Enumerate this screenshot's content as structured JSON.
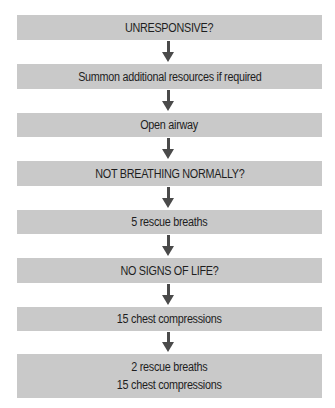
{
  "diagram": {
    "type": "flowchart",
    "direction": "top-to-bottom",
    "colors": {
      "box_fill": "#c9c9c9",
      "arrow": "#4a4a4a",
      "text": "#1e1e1e",
      "background": "#ffffff"
    },
    "steps": [
      {
        "id": "unresponsive",
        "lines": [
          "UNRESPONSIVE?"
        ]
      },
      {
        "id": "summon-resources",
        "lines": [
          "Summon additional resources if required"
        ]
      },
      {
        "id": "open-airway",
        "lines": [
          "Open airway"
        ]
      },
      {
        "id": "not-breathing",
        "lines": [
          "NOT BREATHING NORMALLY?"
        ]
      },
      {
        "id": "rescue-breaths-5",
        "lines": [
          "5 rescue breaths"
        ]
      },
      {
        "id": "no-signs-of-life",
        "lines": [
          "NO SIGNS OF LIFE?"
        ]
      },
      {
        "id": "chest-compressions-15",
        "lines": [
          "15 chest compressions"
        ]
      },
      {
        "id": "cycle",
        "lines": [
          "2 rescue breaths",
          "15 chest compressions"
        ]
      }
    ],
    "connections": [
      {
        "from": "unresponsive",
        "to": "summon-resources"
      },
      {
        "from": "summon-resources",
        "to": "open-airway"
      },
      {
        "from": "open-airway",
        "to": "not-breathing"
      },
      {
        "from": "not-breathing",
        "to": "rescue-breaths-5"
      },
      {
        "from": "rescue-breaths-5",
        "to": "no-signs-of-life"
      },
      {
        "from": "no-signs-of-life",
        "to": "chest-compressions-15"
      },
      {
        "from": "chest-compressions-15",
        "to": "cycle"
      }
    ]
  }
}
